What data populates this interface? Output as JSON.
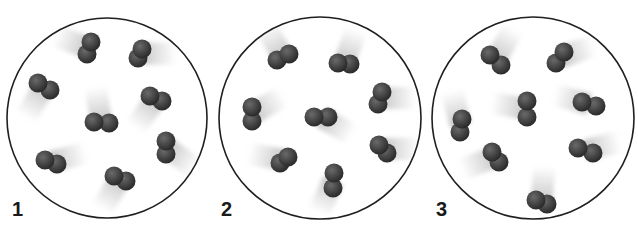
{
  "figure": {
    "colors": {
      "background": "#ffffff",
      "circle_stroke": "#1f1f1f",
      "atom_dark": "#262626",
      "atom_light": "#6a6a6a",
      "trail": "#bdbdbd"
    },
    "panels": [
      {
        "label": "1",
        "label_pos": [
          12,
          199
        ],
        "circle": {
          "cx": 107,
          "cy": 118,
          "r": 100
        },
        "molecules": [
          {
            "a": [
              91,
              42
            ],
            "b": [
              87,
              54
            ],
            "trail_angle": 200
          },
          {
            "a": [
              142,
              49
            ],
            "b": [
              138,
              58
            ],
            "trail_angle": 0
          },
          {
            "a": [
              38,
              83
            ],
            "b": [
              50,
              90
            ],
            "trail_angle": 120
          },
          {
            "a": [
              94,
              122
            ],
            "b": [
              109,
              123
            ],
            "trail_angle": 260
          },
          {
            "a": [
              150,
              96
            ],
            "b": [
              162,
              101
            ],
            "trail_angle": 125
          },
          {
            "a": [
              166,
              141
            ],
            "b": [
              166,
              154
            ],
            "trail_angle": 35
          },
          {
            "a": [
              45,
              160
            ],
            "b": [
              57,
              164
            ],
            "trail_angle": 345
          },
          {
            "a": [
              114,
              176
            ],
            "b": [
              126,
              181
            ],
            "trail_angle": 120
          }
        ]
      },
      {
        "label": "2",
        "label_pos": [
          221,
          199
        ],
        "circle": {
          "cx": 320,
          "cy": 118,
          "r": 101
        },
        "molecules": [
          {
            "a": [
              289,
              54
            ],
            "b": [
              277,
              60
            ],
            "trail_angle": 240
          },
          {
            "a": [
              338,
              63
            ],
            "b": [
              350,
              64
            ],
            "trail_angle": 290
          },
          {
            "a": [
              252,
              107
            ],
            "b": [
              252,
              121
            ],
            "trail_angle": 330
          },
          {
            "a": [
              314,
              117
            ],
            "b": [
              328,
              117
            ],
            "trail_angle": 30
          },
          {
            "a": [
              382,
              92
            ],
            "b": [
              378,
              104
            ],
            "trail_angle": 0
          },
          {
            "a": [
              288,
              157
            ],
            "b": [
              280,
              163
            ],
            "trail_angle": 190
          },
          {
            "a": [
              379,
              145
            ],
            "b": [
              387,
              153
            ],
            "trail_angle": 0
          },
          {
            "a": [
              334,
              173
            ],
            "b": [
              333,
              188
            ],
            "trail_angle": 115
          }
        ]
      },
      {
        "label": "3",
        "label_pos": [
          436,
          199
        ],
        "circle": {
          "cx": 533,
          "cy": 118,
          "r": 101
        },
        "molecules": [
          {
            "a": [
              490,
              55
            ],
            "b": [
              501,
              65
            ],
            "trail_angle": 300
          },
          {
            "a": [
              564,
              52
            ],
            "b": [
              556,
              63
            ],
            "trail_angle": 340
          },
          {
            "a": [
              462,
              119
            ],
            "b": [
              460,
              132
            ],
            "trail_angle": 255
          },
          {
            "a": [
              527,
              101
            ],
            "b": [
              527,
              117
            ],
            "trail_angle": 190
          },
          {
            "a": [
              582,
              102
            ],
            "b": [
              596,
              106
            ],
            "trail_angle": 195
          },
          {
            "a": [
              492,
              152
            ],
            "b": [
              499,
              162
            ],
            "trail_angle": 160
          },
          {
            "a": [
              578,
              148
            ],
            "b": [
              593,
              153
            ],
            "trail_angle": 345
          },
          {
            "a": [
              536,
              200
            ],
            "b": [
              547,
              204
            ],
            "trail_angle": 275
          }
        ]
      }
    ]
  }
}
